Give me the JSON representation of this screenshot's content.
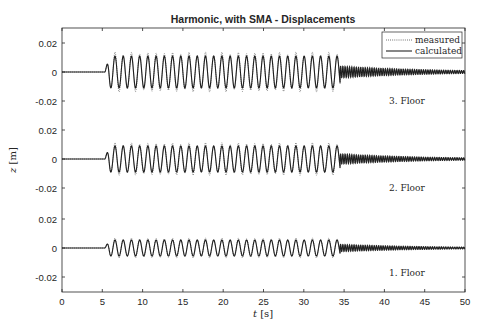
{
  "chart_data": {
    "type": "line",
    "title": "Harmonic, with SMA - Displacements",
    "xlabel": "t [s]",
    "ylabel": "z [m]",
    "xlim": [
      0,
      50
    ],
    "x_ticks": [
      0,
      5,
      10,
      15,
      20,
      25,
      30,
      35,
      40,
      45,
      50
    ],
    "y_tick_labels_per_floor": [
      "0.02",
      "0",
      "-0.02"
    ],
    "grid": false,
    "legend": {
      "position": "upper right",
      "entries": [
        {
          "label": "measured",
          "style": "dotted"
        },
        {
          "label": "calculated",
          "style": "solid"
        }
      ]
    },
    "excitation": {
      "type": "harmonic",
      "start_s": 5.3,
      "end_s": 34.5,
      "frequency_hz": 0.98,
      "free_decay_frequency_hz": 3.6
    },
    "series": [
      {
        "name": "3. Floor",
        "offset_label": "3. Floor",
        "y_range": [
          -0.02,
          0.02
        ],
        "calculated_amplitude": 0.011,
        "measured_peak_amplitude": 0.014,
        "decay_initial_amplitude": 0.004,
        "decay_final_amplitude": 0.001
      },
      {
        "name": "2. Floor",
        "offset_label": "2. Floor",
        "y_range": [
          -0.02,
          0.02
        ],
        "calculated_amplitude": 0.009,
        "measured_peak_amplitude": 0.012,
        "decay_initial_amplitude": 0.0035,
        "decay_final_amplitude": 0.0008
      },
      {
        "name": "1. Floor",
        "offset_label": "1. Floor",
        "y_range": [
          -0.02,
          0.02
        ],
        "calculated_amplitude": 0.0055,
        "measured_peak_amplitude": 0.007,
        "decay_initial_amplitude": 0.0025,
        "decay_final_amplitude": 0.0006
      }
    ]
  },
  "labels": {
    "title": "Harmonic, with SMA - Displacements",
    "xlabel_var": "t",
    "xlabel_unit": " [s]",
    "ylabel_var": "z",
    "ylabel_unit": " [m]",
    "legend_measured": "measured",
    "legend_calculated": "calculated",
    "floor3": "3. Floor",
    "floor2": "2. Floor",
    "floor1": "1. Floor"
  }
}
